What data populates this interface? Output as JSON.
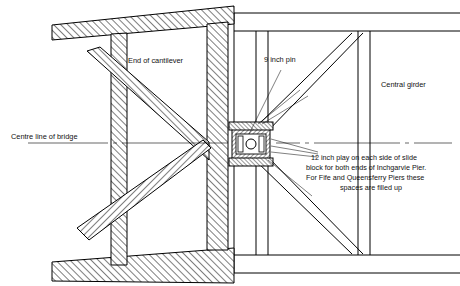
{
  "figure": {
    "labels": {
      "end_of_cantilever": "End of cantilever",
      "centre_line_of_bridge": "Centre line of bridge",
      "nine_inch_pin": "9 inch pin",
      "central_girder": "Central girder",
      "slide_block_note_line1": "12 inch play on each side of slide",
      "slide_block_note_line2": "block for both ends of Inchgarvie Pier.",
      "slide_block_note_line3": "For Fife and Queensferry Piers these",
      "slide_block_note_line4": "spaces are filled up"
    },
    "colors": {
      "ink": "#000000",
      "paper": "#ffffff",
      "hatch": "#000000"
    },
    "geometry": {
      "width": 460,
      "height": 286,
      "centre_line_y": 143,
      "slide_block": {
        "x": 232,
        "y": 128,
        "width": 38,
        "height": 32,
        "pin_diameter": 9
      }
    }
  }
}
